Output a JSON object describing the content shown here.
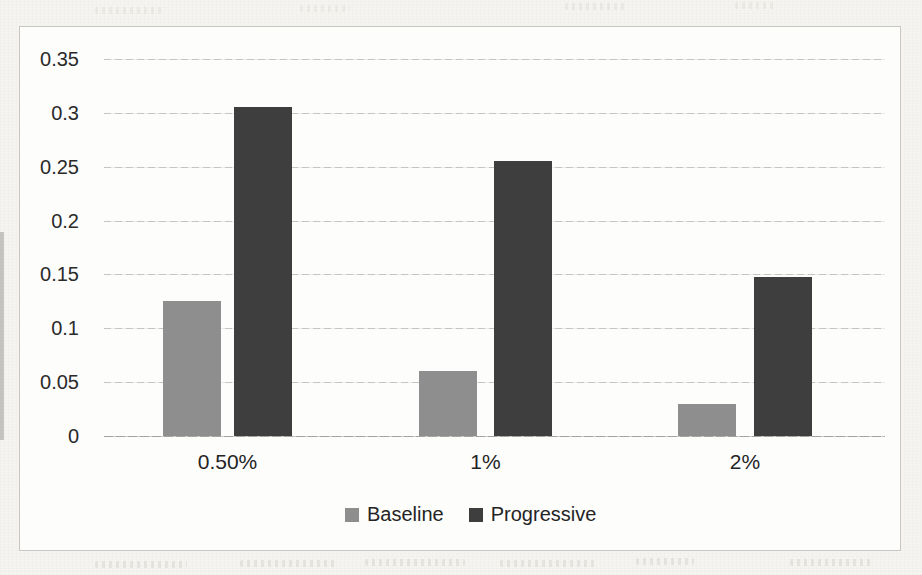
{
  "chart_data": {
    "type": "bar",
    "title": "",
    "xlabel": "",
    "ylabel": "",
    "categories": [
      "0.50%",
      "1%",
      "2%"
    ],
    "series": [
      {
        "name": "Baseline",
        "color": "#8e8e8e",
        "values": [
          0.125,
          0.06,
          0.03
        ]
      },
      {
        "name": "Progressive",
        "color": "#3e3e3e",
        "values": [
          0.305,
          0.255,
          0.148
        ]
      }
    ],
    "ylim": [
      0,
      0.35
    ],
    "ytick_step": 0.05,
    "ytick_labels_top_to_bottom": [
      "0.35",
      "0.3",
      "0.25",
      "0.2",
      "0.15",
      "0.1",
      "0.05",
      "0"
    ],
    "grid": "horizontal",
    "legend_position": "bottom-center",
    "plot_background": "#fdfdfc",
    "gridline_color": "#c5c4c0",
    "text_color": "#262626"
  },
  "appearance": {
    "page_background": "#f5f4f0",
    "frame_border_color": "#c8c7c3",
    "style_note": "scanned grayscale chart on paper"
  }
}
